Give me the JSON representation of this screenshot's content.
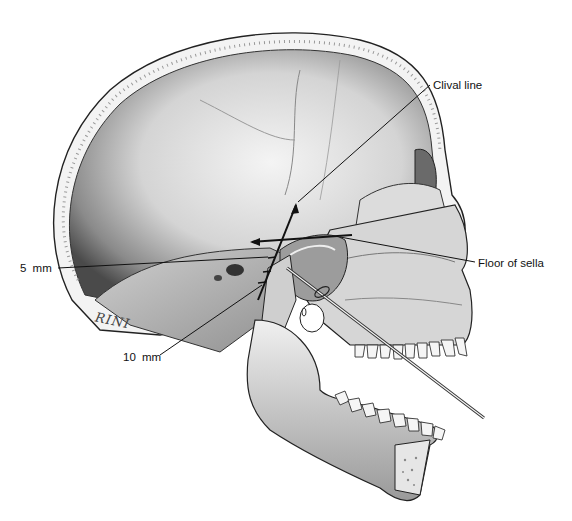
{
  "figure": {
    "labels": {
      "clival_line": "Clival line",
      "five_mm": "5 mm",
      "floor_of_sella": "Floor of sella",
      "ten_mm": "10 mm"
    },
    "artist_signature": "RINI"
  },
  "colors": {
    "background": "#ffffff",
    "ink": "#111111",
    "bone_light": "#e8e8e8",
    "bone_mid": "#bdbdbd",
    "bone_dark": "#7a7a7a",
    "cavity_dark": "#555555"
  }
}
